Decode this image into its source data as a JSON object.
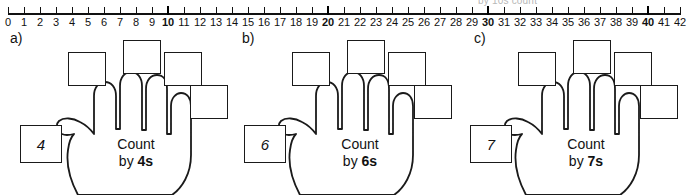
{
  "ghost_header": {
    "text": "by 10s count"
  },
  "number_line": {
    "start": 0,
    "end": 42,
    "labels": [
      "0",
      "1",
      "2",
      "3",
      "4",
      "5",
      "6",
      "7",
      "8",
      "9",
      "10",
      "11",
      "12",
      "13",
      "14",
      "15",
      "16",
      "17",
      "18",
      "19",
      "20",
      "21",
      "22",
      "23",
      "24",
      "25",
      "26",
      "27",
      "28",
      "29",
      "30",
      "31",
      "32",
      "33",
      "34",
      "35",
      "36",
      "37",
      "38",
      "39",
      "40",
      "41",
      "42"
    ],
    "bold_labels": [
      "10",
      "20",
      "30",
      "40"
    ]
  },
  "panels": [
    {
      "id": "a",
      "label": "a)",
      "seed_value": "4",
      "caption_line1": "Count",
      "caption_line2_prefix": "by ",
      "caption_line2_strong": "4s",
      "empty_boxes": [
        "",
        "",
        "",
        ""
      ]
    },
    {
      "id": "b",
      "label": "b)",
      "seed_value": "6",
      "caption_line1": "Count",
      "caption_line2_prefix": "by ",
      "caption_line2_strong": "6s",
      "empty_boxes": [
        "",
        "",
        "",
        ""
      ]
    },
    {
      "id": "c",
      "label": "c)",
      "seed_value": "7",
      "caption_line1": "Count",
      "caption_line2_prefix": "by ",
      "caption_line2_strong": "7s",
      "empty_boxes": [
        "",
        "",
        "",
        ""
      ]
    }
  ],
  "colors": {
    "ink": "#111111",
    "ghost": "#b8b8b8",
    "paper": "#ffffff"
  }
}
